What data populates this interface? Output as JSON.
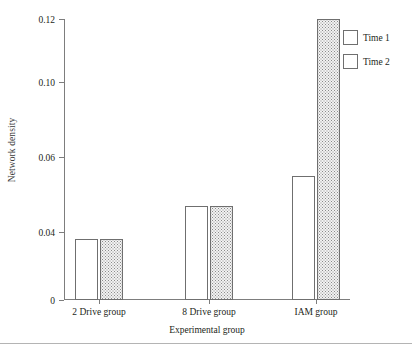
{
  "chart_data": {
    "type": "bar",
    "title": "",
    "xlabel": "Experimental group",
    "ylabel": "Network density",
    "categories": [
      "2 Drive group",
      "8 Drive group",
      "IAM group"
    ],
    "series": [
      {
        "name": "Time 1",
        "fill": "empty",
        "values": [
          0.026,
          0.04,
          0.053
        ]
      },
      {
        "name": "Time 2",
        "fill": "dotted",
        "values": [
          0.026,
          0.04,
          0.12
        ]
      }
    ],
    "ylim": [
      0,
      0.12
    ],
    "ytick_labels": [
      "0.12",
      "0.10",
      "0.06",
      "0.04",
      "0"
    ],
    "ytick_values": [
      0.12,
      0.1,
      0.06,
      0.04,
      0
    ],
    "ytick_positions_px": [
      19,
      82,
      157,
      232,
      300
    ],
    "grid": false,
    "legend_position": "right-top",
    "colors": {
      "axis": "#7d7d7d",
      "bar_outline": "#6f6f6f",
      "bar_fill_time1": "#ffffff",
      "bar_fill_time2": "#f2f2f2",
      "text": "#231f20",
      "footer_rule": "#b4b4b4"
    }
  },
  "legend": {
    "items": [
      {
        "label": "Time 1"
      },
      {
        "label": "Time 2"
      }
    ]
  }
}
